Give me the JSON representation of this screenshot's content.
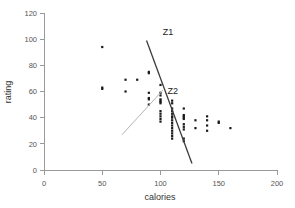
{
  "chart_data": {
    "type": "scatter",
    "title": "",
    "xlabel": "calories",
    "ylabel": "rating",
    "xlim": [
      0,
      200
    ],
    "ylim": [
      0,
      120
    ],
    "xticks": [
      0,
      50,
      100,
      150,
      200
    ],
    "yticks": [
      0,
      20,
      40,
      60,
      80,
      100,
      120
    ],
    "grid": false,
    "legend": "none",
    "marker_color": "#1a1a1a",
    "points": [
      [
        50,
        94
      ],
      [
        50,
        63
      ],
      [
        50,
        62
      ],
      [
        70,
        69
      ],
      [
        70,
        60
      ],
      [
        80,
        69
      ],
      [
        90,
        75
      ],
      [
        90,
        74
      ],
      [
        90,
        59
      ],
      [
        90,
        55
      ],
      [
        90,
        54
      ],
      [
        90,
        50
      ],
      [
        100,
        65
      ],
      [
        100,
        59
      ],
      [
        100,
        57
      ],
      [
        100,
        54
      ],
      [
        100,
        53
      ],
      [
        100,
        52
      ],
      [
        100,
        51
      ],
      [
        100,
        45
      ],
      [
        100,
        43
      ],
      [
        100,
        41
      ],
      [
        100,
        39
      ],
      [
        100,
        37
      ],
      [
        110,
        53
      ],
      [
        110,
        51
      ],
      [
        110,
        47
      ],
      [
        110,
        45
      ],
      [
        110,
        43
      ],
      [
        110,
        41
      ],
      [
        110,
        40
      ],
      [
        110,
        38
      ],
      [
        110,
        36
      ],
      [
        110,
        34
      ],
      [
        110,
        32
      ],
      [
        110,
        30
      ],
      [
        110,
        28
      ],
      [
        110,
        26
      ],
      [
        110,
        24
      ],
      [
        120,
        47
      ],
      [
        120,
        42
      ],
      [
        120,
        41
      ],
      [
        120,
        40
      ],
      [
        120,
        39
      ],
      [
        120,
        35
      ],
      [
        120,
        33
      ],
      [
        120,
        31
      ],
      [
        120,
        24
      ],
      [
        120,
        22
      ],
      [
        130,
        38
      ],
      [
        130,
        32
      ],
      [
        140,
        41
      ],
      [
        140,
        38
      ],
      [
        140,
        34
      ],
      [
        140,
        30
      ],
      [
        150,
        37
      ],
      [
        150,
        36
      ],
      [
        160,
        32
      ]
    ],
    "annotations": [
      {
        "label": "Z1",
        "kind": "line",
        "color": "#3c3c3c",
        "x1": 88,
        "y1": 99,
        "x2": 127,
        "y2": 5,
        "label_x": 102,
        "label_y": 103
      },
      {
        "label": "Z2",
        "kind": "line",
        "color": "#b4b4b4",
        "x1": 67,
        "y1": 27,
        "x2": 102,
        "y2": 61,
        "label_x": 106,
        "label_y": 58
      }
    ]
  },
  "axes": {
    "x_title": "calories",
    "y_title": "rating",
    "x_tick_labels": [
      "0",
      "50",
      "100",
      "150",
      "200"
    ],
    "y_tick_labels": [
      "0",
      "20",
      "40",
      "60",
      "80",
      "100",
      "120"
    ]
  },
  "annotation_labels": {
    "z1": "Z1",
    "z2": "Z2"
  }
}
